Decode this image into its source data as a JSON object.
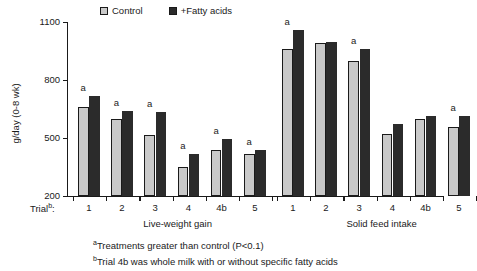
{
  "chart_data": {
    "type": "bar",
    "title": "",
    "xlabel": "",
    "ylabel": "g/day (0-8 wk)",
    "ylim": [
      200,
      1100
    ],
    "yticks": [
      200,
      500,
      800,
      1100
    ],
    "grid": false,
    "legend_position": "top",
    "trial_prefix": "Trial",
    "trial_prefix_sup": "b",
    "groups": [
      {
        "name": "Live-weight gain",
        "categories": [
          "1",
          "2",
          "3",
          "4",
          "4b",
          "5"
        ],
        "series": [
          {
            "name": "Control",
            "values": [
              660,
              600,
              515,
              350,
              440,
              415
            ]
          },
          {
            "name": "+Fatty acids",
            "values": [
              715,
              640,
              635,
              415,
              495,
              440
            ]
          }
        ],
        "significance_markers": [
          "a",
          "a",
          "a",
          "a",
          "a",
          "a"
        ]
      },
      {
        "name": "Solid feed intake",
        "categories": [
          "1",
          "2",
          "3",
          "4",
          "4b",
          "5"
        ],
        "series": [
          {
            "name": "Control",
            "values": [
              960,
              990,
              900,
              520,
              600,
              555
            ]
          },
          {
            "name": "+Fatty acids",
            "values": [
              1060,
              995,
              960,
              570,
              615,
              615
            ]
          }
        ],
        "significance_markers": [
          "a",
          "",
          "a",
          "",
          "",
          "a"
        ]
      }
    ],
    "legend": [
      {
        "label": "Control",
        "color": "#c9c9c9"
      },
      {
        "label": "+Fatty acids",
        "color": "#2b2b2b"
      }
    ],
    "footnotes": [
      {
        "sup": "a",
        "text": "Treatments greater than control (P<0.1)"
      },
      {
        "sup": "b",
        "text": "Trial 4b was whole milk with or without specific fatty acids"
      }
    ]
  }
}
